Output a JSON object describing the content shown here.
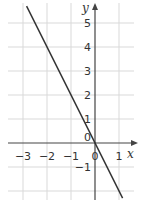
{
  "chart_data": {
    "type": "line",
    "title": "",
    "xlabel": "x",
    "ylabel": "y",
    "xlim": [
      -3.8,
      1.9
    ],
    "ylim": [
      -2.3,
      5.9
    ],
    "grid": true,
    "x_ticks": [
      "-3",
      "-2",
      "-1",
      "0",
      "1"
    ],
    "y_ticks": [
      "-1",
      "0",
      "1",
      "2",
      "3",
      "4",
      "5"
    ],
    "series": [
      {
        "name": "y = -2x",
        "x": [
          -2.85,
          1.15
        ],
        "y": [
          5.7,
          -2.3
        ],
        "color": "#333333"
      }
    ]
  },
  "labels": {
    "x_axis": "x",
    "y_axis": "y",
    "x_ticks": [
      {
        "text": "−3",
        "x": 23
      },
      {
        "text": "−2",
        "x": 47
      },
      {
        "text": "−1",
        "x": 71
      },
      {
        "text": "0",
        "x": 95
      },
      {
        "text": "1",
        "x": 119
      }
    ],
    "y_ticks": [
      {
        "text": "5",
        "y": 23
      },
      {
        "text": "4",
        "y": 47
      },
      {
        "text": "3",
        "y": 71
      },
      {
        "text": "2",
        "y": 95
      },
      {
        "text": "1",
        "y": 119
      },
      {
        "text": "0",
        "y": 143
      },
      {
        "text": "−1",
        "y": 167
      }
    ]
  },
  "colors": {
    "grid": "#d9d9d9",
    "axis": "#444444",
    "line": "#333333"
  }
}
